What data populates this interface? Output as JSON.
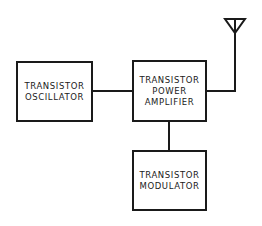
{
  "diagram": {
    "type": "block-diagram",
    "blocks": [
      {
        "id": "oscillator",
        "lines": [
          "TRANSISTOR",
          "OSCILLATOR"
        ]
      },
      {
        "id": "power_amplifier",
        "lines": [
          "TRANSISTOR",
          "POWER",
          "AMPLIFIER"
        ]
      },
      {
        "id": "modulator",
        "lines": [
          "TRANSISTOR",
          "MODULATOR"
        ]
      }
    ],
    "connections": [
      {
        "from": "oscillator",
        "to": "power_amplifier"
      },
      {
        "from": "modulator",
        "to": "power_amplifier"
      },
      {
        "from": "power_amplifier",
        "to": "antenna"
      }
    ],
    "antenna": {
      "icon": "antenna-icon"
    },
    "colors": {
      "line": "#1a1a1a",
      "background": "#ffffff"
    }
  }
}
